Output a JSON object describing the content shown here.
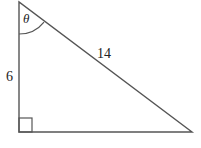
{
  "diagram": {
    "type": "right-triangle",
    "vertices": {
      "top": [
        19,
        2
      ],
      "right_angle": [
        19,
        132
      ],
      "bottom_right": [
        192,
        132
      ]
    },
    "labels": {
      "angle": "θ",
      "vertical_side": "6",
      "hypotenuse": "14"
    },
    "colors": {
      "stroke": "#555555",
      "text": "#222222"
    }
  }
}
